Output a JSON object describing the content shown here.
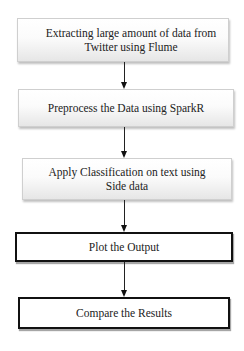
{
  "diagram": {
    "type": "flowchart",
    "direction": "top-to-bottom",
    "steps": [
      {
        "id": "extract",
        "lines": [
          "Extracting large amount of data from",
          "Twitter using Flume"
        ],
        "style": "shaded"
      },
      {
        "id": "preprocess",
        "lines": [
          "Preprocess the Data using SparkR"
        ],
        "style": "shaded"
      },
      {
        "id": "classify",
        "lines": [
          "Apply Classification on text using",
          "Side data"
        ],
        "style": "shaded"
      },
      {
        "id": "plot",
        "lines": [
          "Plot the Output"
        ],
        "style": "bold-outline"
      },
      {
        "id": "compare",
        "lines": [
          "Compare the Results"
        ],
        "style": "bold-outline"
      }
    ],
    "edges": [
      {
        "from": "extract",
        "to": "preprocess"
      },
      {
        "from": "preprocess",
        "to": "classify"
      },
      {
        "from": "classify",
        "to": "plot"
      },
      {
        "from": "plot",
        "to": "compare"
      }
    ],
    "colors": {
      "text": "#222222",
      "arrow": "#111111",
      "shaded_border": "#cfcfcf",
      "bold_border": "#111111"
    }
  }
}
